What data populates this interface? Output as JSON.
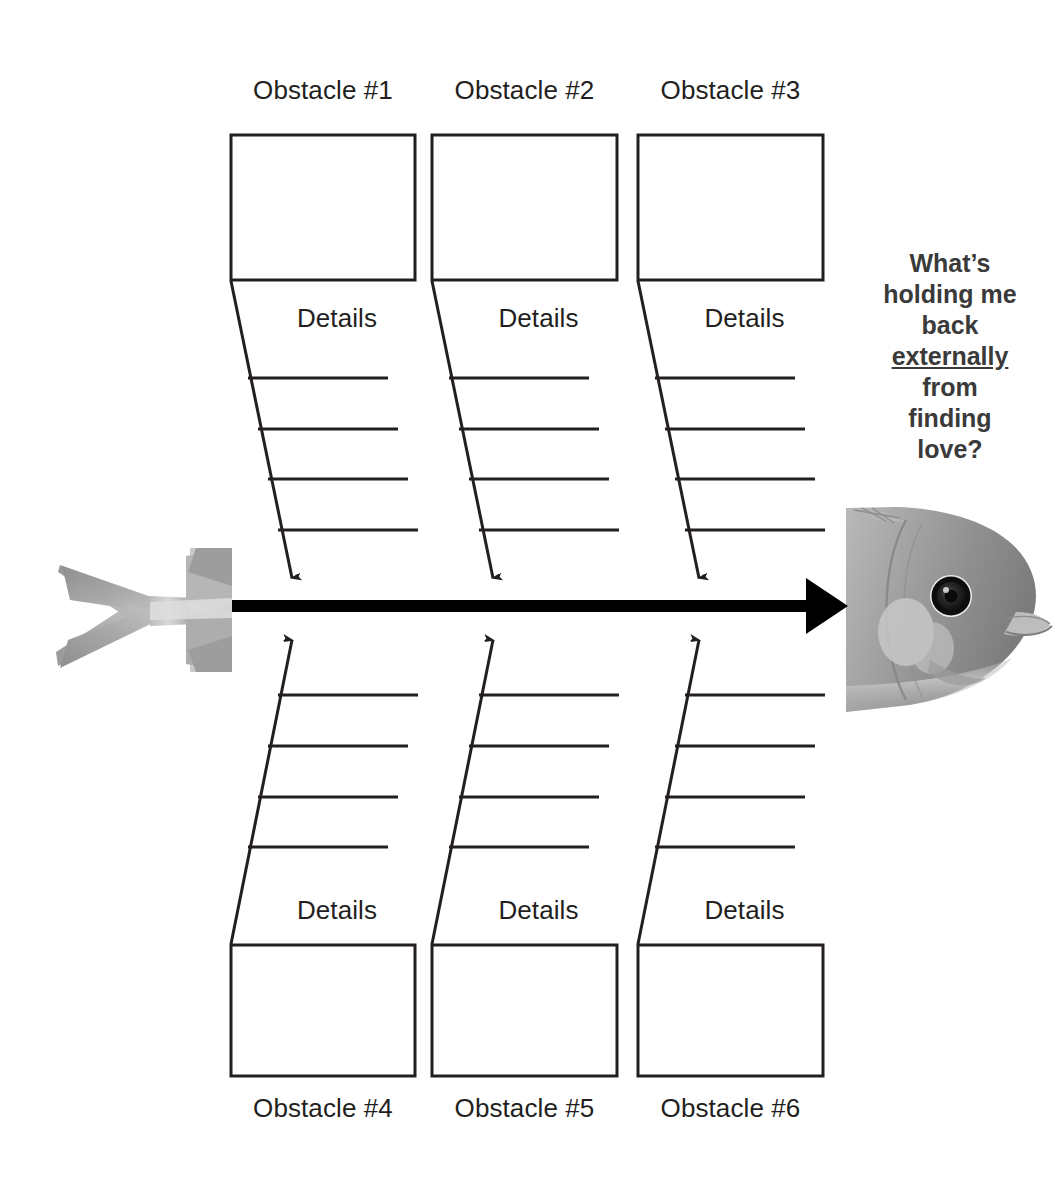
{
  "diagram": {
    "type": "fishbone-cause-and-effect",
    "head_question": {
      "line1": "What’s",
      "line2": "holding me",
      "line3": "back",
      "emphasis": "externally",
      "line5": "from",
      "line6": "finding",
      "line7": "love?",
      "full_text": "What’s holding me back externally from finding love?"
    },
    "top_bones": [
      {
        "label": "Obstacle #1",
        "details_label": "Details",
        "detail_lines": [
          "",
          "",
          "",
          ""
        ]
      },
      {
        "label": "Obstacle #2",
        "details_label": "Details",
        "detail_lines": [
          "",
          "",
          "",
          ""
        ]
      },
      {
        "label": "Obstacle #3",
        "details_label": "Details",
        "detail_lines": [
          "",
          "",
          "",
          ""
        ]
      }
    ],
    "bottom_bones": [
      {
        "label": "Obstacle #4",
        "details_label": "Details",
        "detail_lines": [
          "",
          "",
          "",
          ""
        ]
      },
      {
        "label": "Obstacle #5",
        "details_label": "Details",
        "detail_lines": [
          "",
          "",
          "",
          ""
        ]
      },
      {
        "label": "Obstacle #6",
        "details_label": "Details",
        "detail_lines": [
          "",
          "",
          "",
          ""
        ]
      }
    ],
    "icons": {
      "fish_tail": "fish-tail-image",
      "fish_head": "fish-head-image",
      "spine": "spine-arrow-right"
    },
    "colors": {
      "ink": "#231f20",
      "spine": "#000000",
      "question_text": "#3a3a3a",
      "fish_gray_light": "#c9c9c9",
      "fish_gray_mid": "#9a9a9a",
      "fish_gray_dark": "#6e6e6e",
      "background": "#ffffff"
    }
  }
}
